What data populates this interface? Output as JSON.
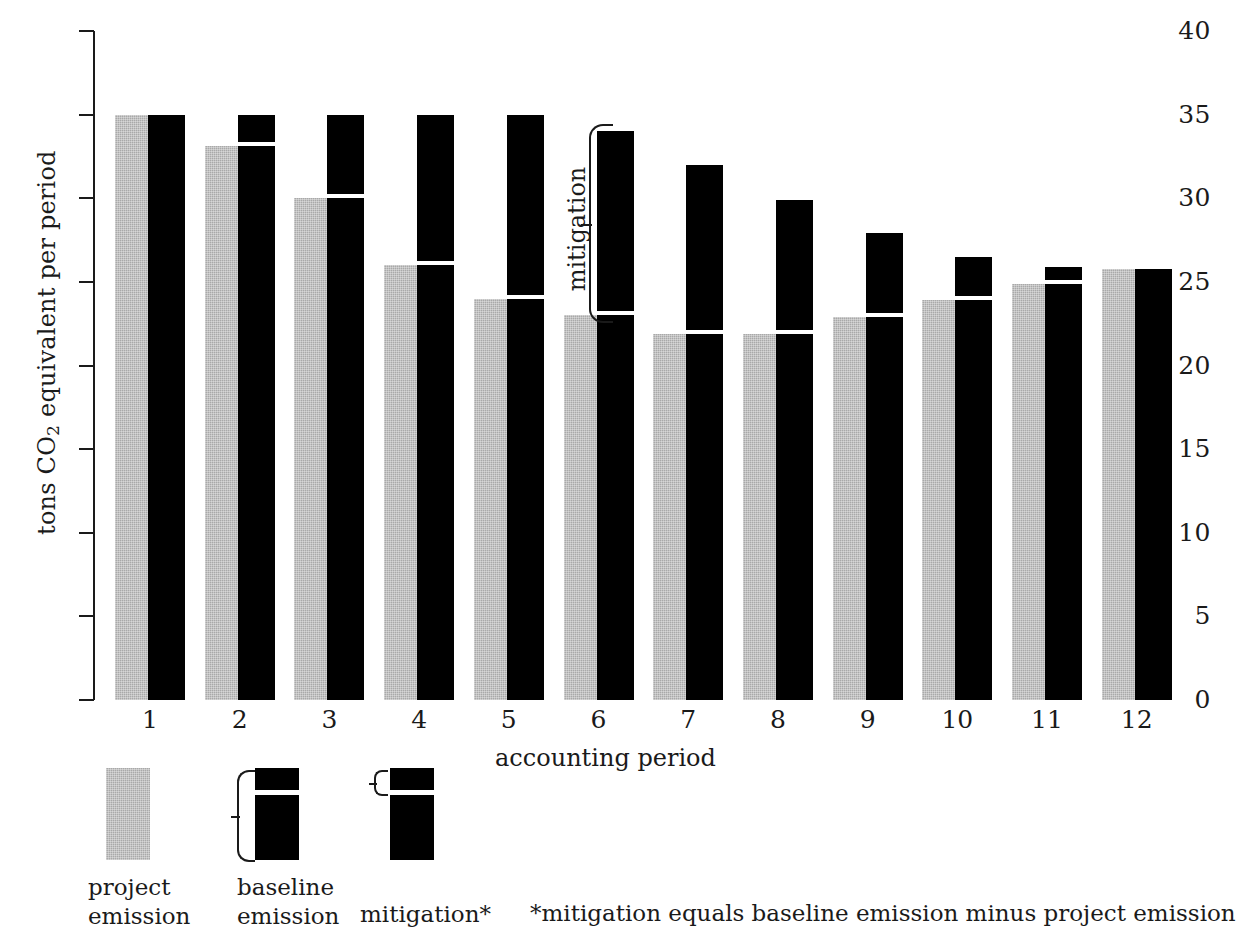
{
  "chart_data": {
    "type": "bar",
    "title": "",
    "xlabel": "accounting period",
    "ylabel": "tons CO2 equivalent per period",
    "ylabel_parts": {
      "pre": "tons CO",
      "sub": "2",
      "post": " equivalent  per period"
    },
    "ylim": [
      0,
      40
    ],
    "ytick_values": [
      0,
      5,
      10,
      15,
      20,
      25,
      30,
      35,
      40
    ],
    "ytick_labels": [
      "0",
      "5",
      "10",
      "15",
      "20",
      "25",
      "30",
      "35",
      "40"
    ],
    "grid": false,
    "legend_position": "below-plot",
    "categories": [
      "1",
      "2",
      "3",
      "4",
      "5",
      "6",
      "7",
      "8",
      "9",
      "10",
      "11",
      "12"
    ],
    "series": [
      {
        "name": "project emission",
        "color": "#a9a9a9",
        "values": [
          35,
          33.1,
          30,
          26,
          24,
          23,
          21.9,
          21.9,
          22.9,
          23.9,
          24.9,
          25.8
        ]
      },
      {
        "name": "baseline emission",
        "color": "#000000",
        "values": [
          35,
          35,
          35,
          35,
          35,
          34,
          32,
          29.9,
          27.9,
          26.5,
          25.9,
          25.8
        ]
      },
      {
        "name": "mitigation",
        "color": "#000000",
        "derived": "baseline emission minus project emission",
        "values": [
          0,
          1.9,
          5,
          9,
          11,
          11,
          10.1,
          8,
          5,
          2.6,
          1,
          0
        ]
      }
    ],
    "annotations": [
      {
        "text": "mitigation",
        "target_category": "6",
        "type": "bracket",
        "from": 23,
        "to": 34
      }
    ]
  },
  "legend": {
    "items": [
      {
        "label_line1": "project",
        "label_line2": "emission",
        "swatch": "solid-gray"
      },
      {
        "label_line1": "baseline",
        "label_line2": "emission",
        "swatch": "black-with-white-line",
        "brace": "large"
      },
      {
        "label_line1": "mitigation*",
        "label_line2": "",
        "swatch": "black-with-white-line",
        "brace": "small"
      }
    ],
    "footnote": "*mitigation equals baseline emission minus project emission"
  }
}
